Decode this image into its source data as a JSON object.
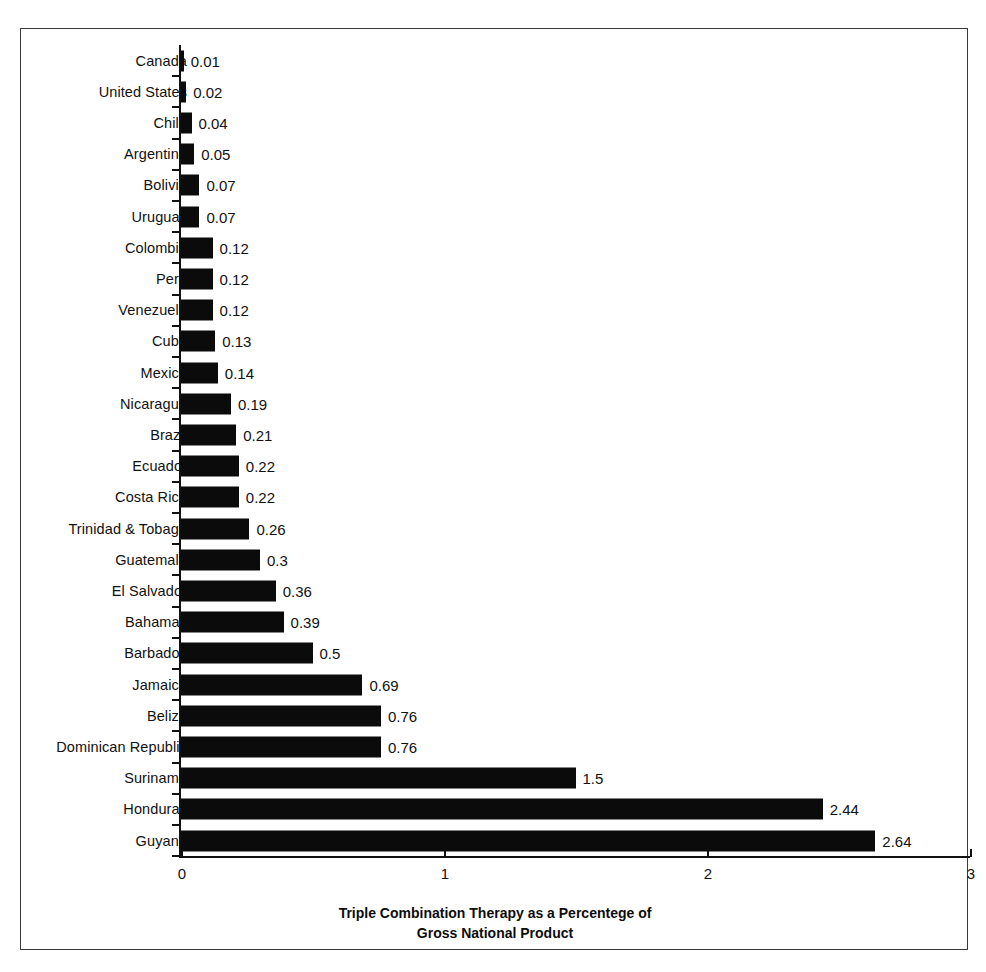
{
  "chart_data": {
    "type": "bar",
    "orientation": "horizontal",
    "title": "",
    "xlabel": "Triple Combination Therapy as a Percentege of Gross National Product",
    "ylabel": "",
    "xlim": [
      0,
      3
    ],
    "grid": false,
    "legend": false,
    "xticks": [
      "0",
      "1",
      "2",
      "3"
    ],
    "xtick_values": [
      0,
      1,
      2,
      3
    ],
    "categories": [
      "Canada",
      "United States",
      "Chile",
      "Argentina",
      "Bolivia",
      "Uruguay",
      "Colombia",
      "Peru",
      "Venezuela",
      "Cuba",
      "Mexico",
      "Nicaragua",
      "Brazil",
      "Ecuador",
      "Costa Rica",
      "Trinidad & Tobago",
      "Guatemala",
      "El Salvador",
      "Bahamas",
      "Barbados",
      "Jamaica",
      "Belize",
      "Dominican Republic",
      "Suriname",
      "Honduras",
      "Guyana"
    ],
    "values": [
      0.01,
      0.02,
      0.04,
      0.05,
      0.07,
      0.07,
      0.12,
      0.12,
      0.12,
      0.13,
      0.14,
      0.19,
      0.21,
      0.22,
      0.22,
      0.26,
      0.3,
      0.36,
      0.39,
      0.5,
      0.69,
      0.76,
      0.76,
      1.5,
      2.44,
      2.64
    ],
    "value_labels": [
      "0.01",
      "0.02",
      "0.04",
      "0.05",
      "0.07",
      "0.07",
      "0.12",
      "0.12",
      "0.12",
      "0.13",
      "0.14",
      "0.19",
      "0.21",
      "0.22",
      "0.22",
      "0.26",
      "0.3",
      "0.36",
      "0.39",
      "0.5",
      "0.69",
      "0.76",
      "0.76",
      "1.5",
      "2.44",
      "2.64"
    ],
    "bar_color": "#0b0b0b",
    "axis_color": "#111111"
  },
  "axis_title": {
    "line1": "Triple Combination Therapy as a Percentege of",
    "line2": "Gross National Product"
  }
}
